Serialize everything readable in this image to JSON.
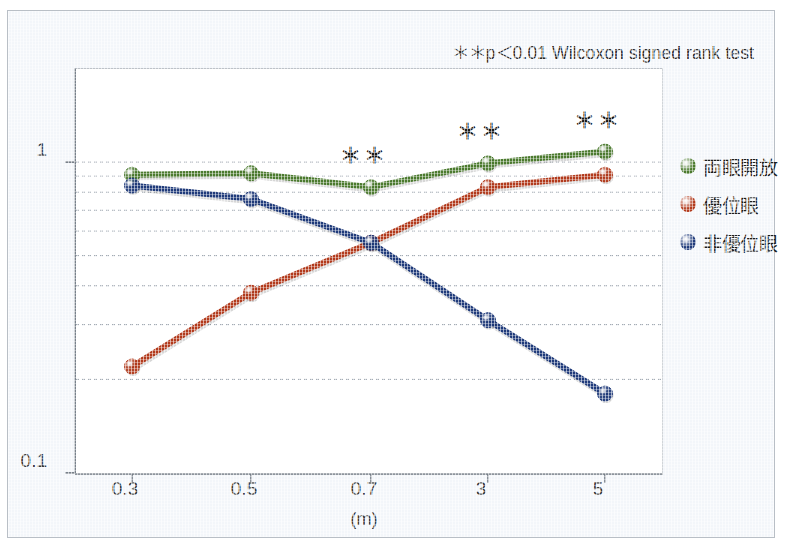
{
  "note": "＊＊p＜0.01 Wilcoxon signed rank test",
  "axes": {
    "y_tick_labels": [
      "1",
      "0.1"
    ],
    "y_min": 0.1,
    "y_max": 1.3,
    "y_scale": "log",
    "x_unit": "(m)"
  },
  "legend": {
    "position": "right",
    "items": [
      {
        "label": "両眼開放",
        "color": "#4b7a2e"
      },
      {
        "label": "優位眼",
        "color": "#b23a1c"
      },
      {
        "label": "非優位眼",
        "color": "#1f3a7a"
      }
    ]
  },
  "annotations": [
    {
      "label": "＊＊",
      "x_category": "0.7"
    },
    {
      "label": "＊＊",
      "x_category": "3"
    },
    {
      "label": "＊＊",
      "x_category": "5"
    }
  ],
  "chart_data": {
    "type": "line",
    "title": "",
    "subtitle": "",
    "xlabel": "(m)",
    "ylabel": "",
    "categories": [
      "0.3",
      "0.5",
      "0.7",
      "3",
      "5"
    ],
    "ylim": [
      0.1,
      1.3
    ],
    "yscale": "log",
    "grid": true,
    "ytick_labels": [
      "1",
      "0.1"
    ],
    "legend_position": "right",
    "annotations": [
      "＊＊ at 0.7 (両眼開放)",
      "＊＊ at 3 (両眼開放)",
      "＊＊ at 5 (両眼開放)"
    ],
    "note": "＊＊p＜0.01 Wilcoxon signed rank test",
    "series": [
      {
        "name": "両眼開放",
        "color": "#4b7a2e",
        "values": [
          0.91,
          0.92,
          0.83,
          0.99,
          1.08
        ]
      },
      {
        "name": "優位眼",
        "color": "#b23a1c",
        "values": [
          0.22,
          0.38,
          0.55,
          0.83,
          0.91
        ]
      },
      {
        "name": "非優位眼",
        "color": "#1f3a7a",
        "values": [
          0.84,
          0.76,
          0.55,
          0.31,
          0.18
        ]
      }
    ]
  }
}
